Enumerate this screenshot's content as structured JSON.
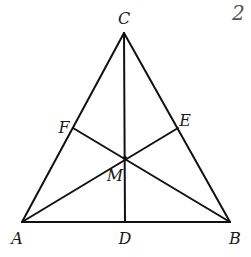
{
  "diagram": {
    "type": "geometry-triangle",
    "page_fragment": "2",
    "points": {
      "A": {
        "label": "A",
        "x": 22,
        "y": 222,
        "lx": 17,
        "ly": 244
      },
      "B": {
        "label": "B",
        "x": 230,
        "y": 222,
        "lx": 235,
        "ly": 244
      },
      "C": {
        "label": "C",
        "x": 124,
        "y": 33,
        "lx": 124,
        "ly": 24
      },
      "D": {
        "label": "D",
        "x": 125,
        "y": 222,
        "lx": 125,
        "ly": 244
      },
      "E": {
        "label": "E",
        "x": 178,
        "y": 128,
        "lx": 185,
        "ly": 126
      },
      "F": {
        "label": "F",
        "x": 73,
        "y": 128,
        "lx": 64,
        "ly": 133
      },
      "M": {
        "label": "M",
        "x": 125,
        "y": 158,
        "lx": 115,
        "ly": 181
      }
    },
    "segments": [
      [
        "A",
        "B"
      ],
      [
        "B",
        "C"
      ],
      [
        "C",
        "A"
      ],
      [
        "C",
        "D"
      ],
      [
        "A",
        "E"
      ],
      [
        "B",
        "F"
      ]
    ],
    "colors": {
      "stroke": "#111111",
      "label": "#1a1a1a"
    }
  }
}
